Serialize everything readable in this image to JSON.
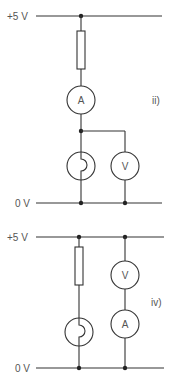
{
  "circuits": [
    {
      "id": "ii",
      "label": "ii)",
      "rail_top_label": "+5 V",
      "rail_bottom_label": "0 V",
      "components": [
        {
          "type": "resistor"
        },
        {
          "type": "ammeter",
          "symbol": "A"
        },
        {
          "type": "lamp"
        },
        {
          "type": "voltmeter",
          "symbol": "V"
        }
      ]
    },
    {
      "id": "iv",
      "label": "iv)",
      "rail_top_label": "+5 V",
      "rail_bottom_label": "0 V",
      "components": [
        {
          "type": "resistor"
        },
        {
          "type": "lamp"
        },
        {
          "type": "voltmeter",
          "symbol": "V"
        },
        {
          "type": "ammeter",
          "symbol": "A"
        }
      ]
    }
  ]
}
